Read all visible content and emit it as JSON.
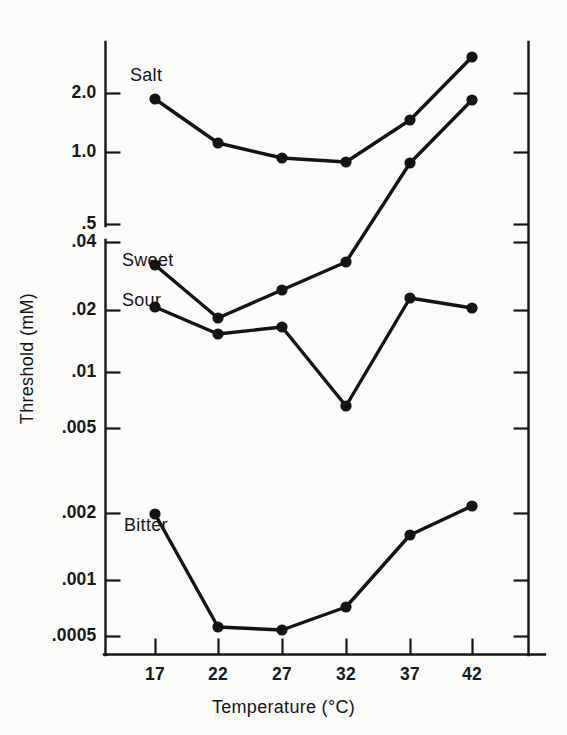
{
  "chart_data": {
    "type": "line",
    "title": "",
    "xlabel": "Temperature (°C)",
    "ylabel": "Threshold (mM)",
    "x": [
      17,
      22,
      27,
      32,
      37,
      42
    ],
    "categories": [
      "17",
      "22",
      "27",
      "32",
      "37",
      "42"
    ],
    "xtick_labels": [
      "17",
      "22",
      "27",
      "32",
      "37",
      "42"
    ],
    "yscale": "log-broken",
    "grid": false,
    "legend": "inline-labels",
    "y_axis_note": "Broken logarithmic axis: upper segment spans .5 to above 2.0; lower segment spans .0005 to .04",
    "ytick_labels_upper": [
      "2.0",
      "1.0",
      ".5"
    ],
    "ytick_labels_lower": [
      ".04",
      ".02",
      ".01",
      ".005",
      ".002",
      ".001",
      ".0005"
    ],
    "ytick_values_upper": [
      2.0,
      1.0,
      0.5
    ],
    "ytick_values_lower": [
      0.04,
      0.02,
      0.01,
      0.005,
      0.002,
      0.001,
      0.0005
    ],
    "series": [
      {
        "name": "Salt",
        "axis_segment": "upper",
        "values": [
          1.9,
          1.1,
          0.95,
          0.92,
          1.5,
          2.5
        ]
      },
      {
        "name": "Sweet",
        "axis_segment": "lower",
        "values": [
          0.03,
          0.0165,
          0.025,
          0.033,
          0.095,
          0.19
        ]
      },
      {
        "name": "Sour",
        "axis_segment": "lower",
        "values": [
          0.0155,
          0.0125,
          0.0135,
          0.0068,
          0.021,
          0.019
        ]
      },
      {
        "name": "Bitter",
        "axis_segment": "lower",
        "values": [
          0.002,
          0.00058,
          0.00056,
          0.00077,
          0.0016,
          0.0028
        ]
      }
    ],
    "colors": {
      "ink": "#131313",
      "background": "#fbfbfa"
    }
  },
  "axis": {
    "y_title": "Threshold (mM)",
    "x_title": "Temperature (°C)",
    "y_ticks": [
      {
        "label": "2.0",
        "y": 93
      },
      {
        "label": "1.0",
        "y": 152
      },
      {
        "label": ".5",
        "y": 224
      },
      {
        "label": ".04",
        "y": 242
      },
      {
        "label": ".02",
        "y": 310
      },
      {
        "label": ".01",
        "y": 372
      },
      {
        "label": ".005",
        "y": 428
      },
      {
        "label": ".002",
        "y": 513
      },
      {
        "label": ".001",
        "y": 580
      },
      {
        "label": ".0005",
        "y": 636
      }
    ],
    "x_ticks": [
      {
        "label": "17",
        "x": 155
      },
      {
        "label": "22",
        "x": 218
      },
      {
        "label": "27",
        "x": 282
      },
      {
        "label": "32",
        "x": 346
      },
      {
        "label": "37",
        "x": 410
      },
      {
        "label": "42",
        "x": 472
      }
    ]
  },
  "series_labels": [
    {
      "name": "Salt",
      "x": 130,
      "y": 66
    },
    {
      "name": "Sweet",
      "x": 122,
      "y": 251
    },
    {
      "name": "Sour",
      "x": 122,
      "y": 291
    },
    {
      "name": "Bitter",
      "x": 124,
      "y": 516
    }
  ],
  "series_pixels": [
    {
      "name": "Salt",
      "points": [
        [
          155,
          99
        ],
        [
          218,
          143
        ],
        [
          282,
          158
        ],
        [
          346,
          162
        ],
        [
          410,
          120
        ],
        [
          472,
          57
        ]
      ]
    },
    {
      "name": "Sweet",
      "points": [
        [
          155,
          265
        ],
        [
          218,
          318
        ],
        [
          282,
          290
        ],
        [
          346,
          262
        ],
        [
          410,
          163
        ],
        [
          472,
          100
        ]
      ]
    },
    {
      "name": "Sour",
      "points": [
        [
          155,
          307
        ],
        [
          218,
          334
        ],
        [
          282,
          327
        ],
        [
          346,
          406
        ],
        [
          410,
          298
        ],
        [
          472,
          308
        ]
      ]
    },
    {
      "name": "Bitter",
      "points": [
        [
          155,
          514
        ],
        [
          218,
          627
        ],
        [
          282,
          630
        ],
        [
          346,
          607
        ],
        [
          410,
          535
        ],
        [
          472,
          506
        ]
      ]
    }
  ]
}
